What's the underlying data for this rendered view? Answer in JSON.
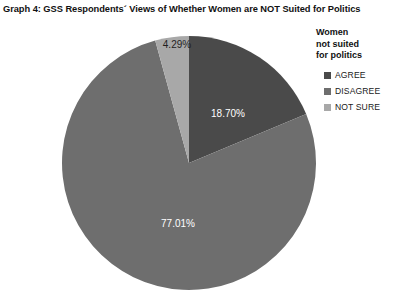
{
  "chart_data": {
    "type": "pie",
    "title": "Graph 4: GSS Respondents´ Views of Whether Women are NOT Suited for Politics",
    "legend_title": "Women\nnot suited\nfor politics",
    "legend_position": "right",
    "grid": false,
    "xlabel": "",
    "ylabel": "",
    "start_angle_deg": 0,
    "direction": "clockwise",
    "categories": [
      "AGREE",
      "DISAGREE",
      "NOT SURE"
    ],
    "values": [
      18.7,
      77.01,
      4.29
    ],
    "value_unit": "percent",
    "data_labels": [
      "18.70%",
      "77.01%",
      "4.29%"
    ],
    "slices": [
      {
        "label": "AGREE",
        "value": 18.7,
        "display": "18.70%",
        "color": "#4a4a4a",
        "label_color": "#ffffff",
        "start_deg": 0,
        "end_deg": 67.32,
        "label_x": 168,
        "label_y": 80,
        "label_dark": false
      },
      {
        "label": "DISAGREE",
        "value": 77.01,
        "display": "77.01%",
        "color": "#6e6e6e",
        "label_color": "#ffffff",
        "start_deg": 67.32,
        "end_deg": 344.56,
        "label_x": 118,
        "label_y": 190,
        "label_dark": false
      },
      {
        "label": "NOT SURE",
        "value": 4.29,
        "display": "4.29%",
        "color": "#a8a8a8",
        "label_color": "#1f1f1f",
        "start_deg": 344.56,
        "end_deg": 360,
        "label_x": 117,
        "label_y": 11,
        "label_dark": true
      }
    ],
    "geometry": {
      "cx": 129,
      "cy": 129,
      "r": 127
    },
    "colors": {
      "agree": "#4a4a4a",
      "disagree": "#6e6e6e",
      "not_sure": "#a8a8a8",
      "background": "#ffffff",
      "text": "#1a1a1a"
    }
  }
}
